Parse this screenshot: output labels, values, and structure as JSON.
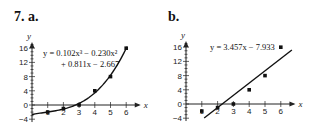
{
  "panels": {
    "a": {
      "label": "7. a.",
      "equation_line1": "y = 0.102x³ − 0.230x²",
      "equation_line2": "+ 0.811x − 2.667"
    },
    "b": {
      "label": "b.",
      "equation_line1": "y = 3.457x − 7.933"
    }
  },
  "axes": {
    "x_title": "x",
    "y_title": "y",
    "x_ticks": [
      "1",
      "2",
      "3",
      "4",
      "5",
      "6"
    ],
    "y_ticks": [
      "16",
      "12",
      "8",
      "4",
      "0",
      "-4"
    ]
  },
  "chart_data": [
    {
      "type": "scatter",
      "title": "7. a.",
      "xlabel": "x",
      "ylabel": "y",
      "x": [
        1,
        2,
        3,
        4,
        5,
        6
      ],
      "y": [
        -2,
        -1,
        0,
        4,
        8,
        16
      ],
      "fit": {
        "kind": "cubic",
        "equation": "y = 0.102x^3 - 0.230x^2 + 0.811x - 2.667",
        "coefficients": [
          0.102,
          -0.23,
          0.811,
          -2.667
        ]
      },
      "xlim": [
        0,
        6.5
      ],
      "ylim": [
        -4,
        17
      ],
      "x_ticks": [
        1,
        2,
        3,
        4,
        5,
        6
      ],
      "y_ticks": [
        -4,
        0,
        4,
        8,
        12,
        16
      ],
      "grid": false,
      "legend": "none"
    },
    {
      "type": "scatter",
      "title": "b.",
      "xlabel": "x",
      "ylabel": "y",
      "x": [
        1,
        2,
        3,
        4,
        5,
        6
      ],
      "y": [
        -2,
        -1,
        0,
        4,
        8,
        16
      ],
      "fit": {
        "kind": "linear",
        "equation": "y = 3.457x - 7.933",
        "coefficients": [
          3.457,
          -7.933
        ]
      },
      "xlim": [
        0,
        6.5
      ],
      "ylim": [
        -4,
        17
      ],
      "x_ticks": [
        1,
        2,
        3,
        4,
        5,
        6
      ],
      "y_ticks": [
        -4,
        0,
        4,
        8,
        12,
        16
      ],
      "grid": false,
      "legend": "none"
    }
  ]
}
